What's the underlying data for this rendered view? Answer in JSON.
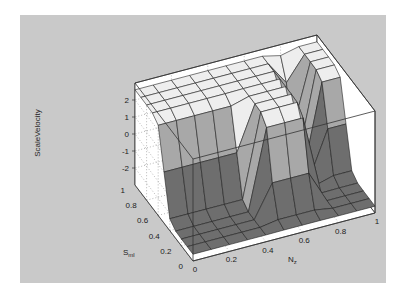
{
  "chart_data": {
    "type": "surface",
    "title": "",
    "xlabel": "N_z",
    "ylabel": "S_ml",
    "zlabel": "ScaleVelocity",
    "x_ticks": [
      "0",
      "0.2",
      "0.4",
      "0.6",
      "0.8",
      "1"
    ],
    "y_ticks": [
      "0",
      "0.2",
      "0.4",
      "0.6",
      "0.8",
      "1"
    ],
    "z_ticks": [
      "-2",
      "-1",
      "0",
      "1",
      "2"
    ],
    "xlim": [
      0,
      1
    ],
    "ylim": [
      0,
      1
    ],
    "zlim": [
      -3,
      3
    ],
    "grid": true,
    "x": [
      0,
      0.1,
      0.2,
      0.3,
      0.4,
      0.5,
      0.6,
      0.7,
      0.8,
      0.9,
      1.0
    ],
    "y": [
      0,
      0.1,
      0.2,
      0.3,
      0.4,
      0.5,
      0.6,
      0.7,
      0.8,
      0.9,
      1.0
    ],
    "z_description": "High plateau (~2.5) for S_ml > ~0.55; low floor (~-2.5) for S_ml < ~0.4; for N_z between ~0.45 and ~0.75 the high plateau extends further, with a narrow ridge dipping near N_z≈0.75–0.8",
    "colors": {
      "high": "#eeeeee",
      "mid": "#a8a8a8",
      "low": "#6e6e6e",
      "edge": "#222222",
      "axes_bg": "#ffffff",
      "figure_bg": "#c9c9c9"
    }
  },
  "labels": {
    "zlabel": "ScaleVelocity",
    "xlabel_main": "N",
    "xlabel_sub": "z",
    "ylabel_main": "S",
    "ylabel_sub": "ml"
  }
}
